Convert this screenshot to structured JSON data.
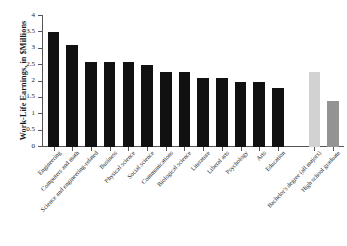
{
  "chart_data": {
    "type": "bar",
    "title": "",
    "xlabel": "",
    "ylabel": "Work-Life Earnings, in $Millions",
    "ylim": [
      0,
      4
    ],
    "ytick_labels": [
      "0",
      "0.5",
      "1",
      "1.5",
      "2",
      "2.5",
      "3",
      "3.5",
      "4"
    ],
    "ytick_values": [
      0,
      0.5,
      1,
      1.5,
      2,
      2.5,
      3,
      3.5,
      4
    ],
    "grid": false,
    "legend": "none",
    "categories": [
      "Engineering",
      "Computers and math",
      "Science and engineering-related",
      "Business",
      "Physical science",
      "Social science",
      "Communications",
      "Biological science",
      "Literature",
      "Liberal arts",
      "Psychology",
      "Arts",
      "Education",
      "Bachelor's degree (all majors)",
      "High school graduate"
    ],
    "values": [
      3.5,
      3.1,
      2.6,
      2.6,
      2.6,
      2.5,
      2.3,
      2.3,
      2.1,
      2.1,
      2.0,
      2.0,
      1.8,
      2.3,
      1.4
    ],
    "bar_colors": [
      "#111111",
      "#111111",
      "#111111",
      "#111111",
      "#111111",
      "#111111",
      "#111111",
      "#111111",
      "#111111",
      "#111111",
      "#111111",
      "#111111",
      "#111111",
      "#d2d2d2",
      "#939393"
    ],
    "group_gap_after_index": 12,
    "axis_color": "#555555"
  }
}
